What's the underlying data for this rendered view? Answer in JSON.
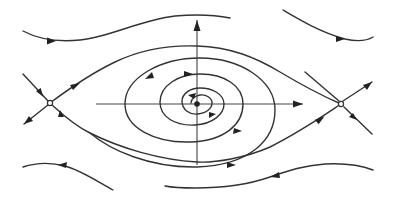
{
  "figure": {
    "kind": "phase-portrait",
    "colors": {
      "stroke": "#333333",
      "background": "#ffffff"
    },
    "equilibria": [
      {
        "name": "left-saddle",
        "type": "saddle",
        "x": 50,
        "y": 103
      },
      {
        "name": "center-focus",
        "type": "spiral-focus",
        "x": 197,
        "y": 104
      },
      {
        "name": "right-saddle",
        "type": "saddle",
        "x": 341,
        "y": 104
      }
    ],
    "axes": {
      "horizontal": {
        "from": [
          96,
          104
        ],
        "to": [
          303,
          104
        ],
        "arrow": "right"
      },
      "vertical": {
        "from": [
          197,
          165
        ],
        "to": [
          197,
          20
        ],
        "arrow": "up"
      }
    },
    "text_labels": []
  }
}
